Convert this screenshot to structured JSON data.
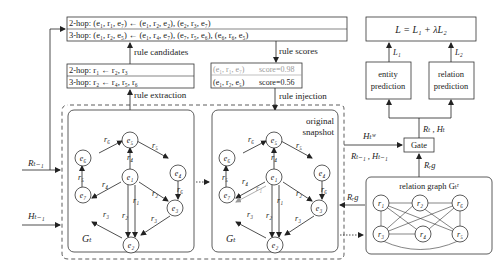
{
  "rule_candidates_box": {
    "line1": "2-hop: (e₁, r₁, e₇) ← (e₁, r₂, e₂), (e₂, r₃, e₇)",
    "line2": "3-hop: (e₁, r₂, e₅) ← (e₁, r₄, e₇), (e₇, r₅, e₆), (e₆, r₆, e₅)"
  },
  "rules_box": {
    "line1": "2-hop: r₁ ← r₂, r₃",
    "line2": "3-hop: r₂ ← r₄, r₅, r₆"
  },
  "scores_box": {
    "line1_triple": "(e₁, r₁, e₇)",
    "line1_score": "score=0.98",
    "line2_triple": "(e₁, r₂, e₅)",
    "line2_score": "score=0.56"
  },
  "labels": {
    "rule_candidates": "rule candidates",
    "rule_extraction": "rule extraction",
    "rule_scores": "rule scores",
    "rule_injection": "rule injection",
    "original_snapshot_1": "original",
    "original_snapshot_2": "snapshot",
    "R_prev": "Rₜ₋₁",
    "H_prev": "Hₜ₋₁",
    "H_w": "Hₜʷ",
    "R_H_prev": "Rₜ₋₁ , Hₜ₋₁",
    "R_H_t": "Rₜ , Hₜ",
    "R_rg_up": "Rᵣg",
    "R_rg_left": "Rᵣg",
    "gate": "Gate",
    "relation_graph": "relation graph Gₜʳ",
    "loss": "L = L₁ + λL₂",
    "L1": "L₁",
    "L2": "L₂",
    "entity_prediction_1": "entity",
    "entity_prediction_2": "prediction",
    "relation_prediction_1": "relation",
    "relation_prediction_2": "prediction",
    "G_left": "Gₜ",
    "G_right": "Gₜ"
  },
  "graph": {
    "nodes": [
      "e₁",
      "e₂",
      "e₃",
      "e₄",
      "e₅",
      "e₆",
      "e₇"
    ],
    "edge_labels": {
      "e6_e5": "r₆",
      "e5_e4": "r₅",
      "e1_e5": "r₄",
      "e4_e3": "r₆",
      "e7_e6": "r₅",
      "e1_e7": "r₄",
      "e1_e3": "r₂",
      "e1_e2_a": "r₂",
      "e1_e2_b": "r₁",
      "e2_e7": "r₃",
      "e3_e2": "r₃",
      "injected_e1_e7": "r₁"
    }
  },
  "relation_graph_nodes": [
    "r₁",
    "r₂",
    "r₆",
    "r₃",
    "r₄",
    "r₅"
  ]
}
